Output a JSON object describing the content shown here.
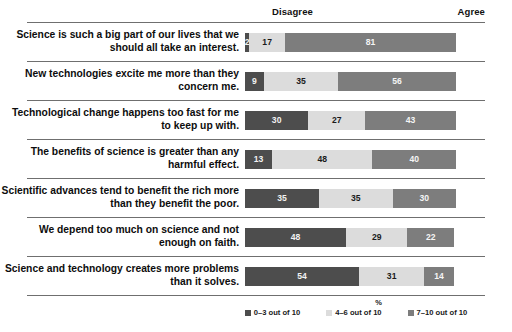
{
  "header": {
    "left_label": "Disagree",
    "right_label": "Agree"
  },
  "axis": {
    "xlabel": "%"
  },
  "legend": {
    "items": [
      {
        "label": "0–3 out of 10",
        "color": "#4d4d4d"
      },
      {
        "label": "4–6 out of 10",
        "color": "#dcdcdc"
      },
      {
        "label": "7–10 out of 10",
        "color": "#7d7d7d"
      }
    ]
  },
  "chart_data": {
    "type": "bar",
    "subtype": "stacked-horizontal-100",
    "title": "",
    "xlabel": "%",
    "ylabel": "",
    "xlim": [
      0,
      100
    ],
    "grid": false,
    "legend_position": "bottom",
    "annotations": [
      "Disagree",
      "Agree"
    ],
    "series": [
      {
        "name": "0–3 out of 10",
        "color": "#4d4d4d",
        "values": [
          2,
          9,
          30,
          13,
          35,
          48,
          54
        ]
      },
      {
        "name": "4–6 out of 10",
        "color": "#dcdcdc",
        "values": [
          17,
          35,
          27,
          48,
          35,
          29,
          31
        ]
      },
      {
        "name": "7–10 out of 10",
        "color": "#7d7d7d",
        "values": [
          81,
          56,
          43,
          40,
          30,
          22,
          14
        ]
      }
    ],
    "categories": [
      "Science is such a big part of our lives that we should all take an interest.",
      "New technologies excite me more than they concern me.",
      "Technological change happens too fast for me to keep up with.",
      "The benefits of science is greater than any harmful effect.",
      "Scientific advances tend to benefit the rich more than they benefit the poor.",
      "We depend too much on science and not enough on faith.",
      "Science and technology creates more problems than it solves."
    ]
  },
  "rows": [
    {
      "label": "Science is such a big part of our lives that we should all take an interest.",
      "segments": [
        {
          "value": "2",
          "pct": 2
        },
        {
          "value": "17",
          "pct": 17
        },
        {
          "value": "81",
          "pct": 81
        }
      ]
    },
    {
      "label": "New technologies excite me more than they concern me.",
      "segments": [
        {
          "value": "9",
          "pct": 9
        },
        {
          "value": "35",
          "pct": 35
        },
        {
          "value": "56",
          "pct": 56
        }
      ]
    },
    {
      "label": "Technological change happens too fast for me to keep up with.",
      "segments": [
        {
          "value": "30",
          "pct": 30
        },
        {
          "value": "27",
          "pct": 27
        },
        {
          "value": "43",
          "pct": 43
        }
      ]
    },
    {
      "label": "The benefits of science is greater than any harmful effect.",
      "segments": [
        {
          "value": "13",
          "pct": 13
        },
        {
          "value": "48",
          "pct": 48
        },
        {
          "value": "40",
          "pct": 40
        }
      ]
    },
    {
      "label": "Scientific advances tend to benefit the rich more than they benefit the poor.",
      "segments": [
        {
          "value": "35",
          "pct": 35
        },
        {
          "value": "35",
          "pct": 35
        },
        {
          "value": "30",
          "pct": 30
        }
      ]
    },
    {
      "label": "We depend too much on science and not enough on faith.",
      "segments": [
        {
          "value": "48",
          "pct": 48
        },
        {
          "value": "29",
          "pct": 29
        },
        {
          "value": "22",
          "pct": 22
        }
      ]
    },
    {
      "label": "Science and technology creates more problems than it solves.",
      "segments": [
        {
          "value": "54",
          "pct": 54
        },
        {
          "value": "31",
          "pct": 31
        },
        {
          "value": "14",
          "pct": 14
        }
      ]
    }
  ]
}
